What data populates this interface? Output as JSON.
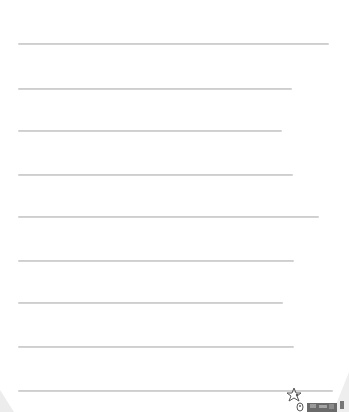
{
  "page": {
    "type": "lined-paper",
    "background_color": "#ffffff",
    "rule_color": "#c8c8c8",
    "rules": [
      {
        "y": 43,
        "x_start": 18,
        "x_end": 329
      },
      {
        "y": 88,
        "x_start": 18,
        "x_end": 292
      },
      {
        "y": 130,
        "x_start": 18,
        "x_end": 282
      },
      {
        "y": 174,
        "x_start": 18,
        "x_end": 293
      },
      {
        "y": 216,
        "x_start": 18,
        "x_end": 319
      },
      {
        "y": 260,
        "x_start": 18,
        "x_end": 294
      },
      {
        "y": 302,
        "x_start": 18,
        "x_end": 283
      },
      {
        "y": 346,
        "x_start": 18,
        "x_end": 294
      },
      {
        "y": 390,
        "x_start": 18,
        "x_end": 333
      }
    ]
  },
  "decorations": {
    "corner_doodle": "star-and-critters-icon"
  }
}
